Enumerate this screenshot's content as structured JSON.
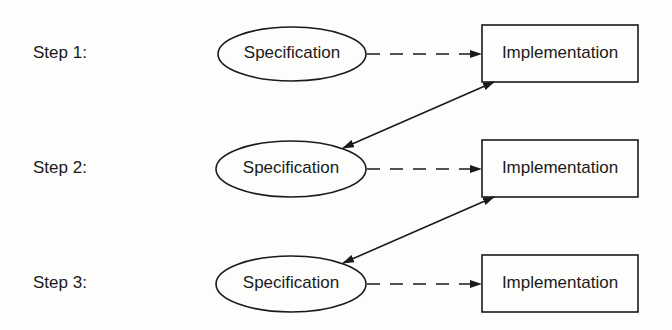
{
  "diagram": {
    "type": "flow",
    "colors": {
      "stroke": "#1a1a1a",
      "background": "#fdfdfc"
    },
    "steps": [
      {
        "label": "Step 1:",
        "spec": "Specification",
        "impl": "Implementation"
      },
      {
        "label": "Step 2:",
        "spec": "Specification",
        "impl": "Implementation"
      },
      {
        "label": "Step 3:",
        "spec": "Specification",
        "impl": "Implementation"
      }
    ],
    "edges": [
      {
        "from": "step1.spec",
        "to": "step1.impl",
        "style": "dashed",
        "arrow": "end"
      },
      {
        "from": "step1.impl",
        "to": "step2.spec",
        "style": "solid",
        "arrow": "both"
      },
      {
        "from": "step2.spec",
        "to": "step2.impl",
        "style": "dashed",
        "arrow": "end"
      },
      {
        "from": "step2.impl",
        "to": "step3.spec",
        "style": "solid",
        "arrow": "both"
      },
      {
        "from": "step3.spec",
        "to": "step3.impl",
        "style": "dashed",
        "arrow": "end"
      }
    ]
  }
}
